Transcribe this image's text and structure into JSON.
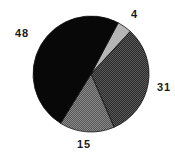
{
  "chart_data": {
    "type": "pie",
    "title": "",
    "categories": [
      "4",
      "31",
      "15",
      "48"
    ],
    "values": [
      4,
      31,
      15,
      48
    ],
    "slices": [
      {
        "label": "4",
        "value": 4,
        "color": "#b8b8b8",
        "pattern": "light-gray"
      },
      {
        "label": "31",
        "value": 31,
        "color": "#3a3a3a",
        "pattern": "dark-dither"
      },
      {
        "label": "15",
        "value": 15,
        "color": "#6a6a6a",
        "pattern": "medium-dither"
      },
      {
        "label": "48",
        "value": 48,
        "color": "#0a0a0a",
        "pattern": "solid-black"
      }
    ],
    "start_angle_deg": -62,
    "direction": "clockwise",
    "legend": "none",
    "data_labels": "outside"
  },
  "labels": {
    "l4": "4",
    "l31": "31",
    "l15": "15",
    "l48": "48"
  }
}
